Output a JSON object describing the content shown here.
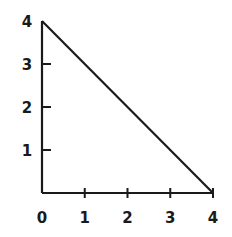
{
  "chart_data": {
    "type": "line",
    "title": "",
    "xlabel": "",
    "ylabel": "",
    "xlim": [
      0,
      4
    ],
    "ylim": [
      0,
      4
    ],
    "grid": false,
    "legend": null,
    "x_ticks": [
      "0",
      "1",
      "2",
      "3",
      "4"
    ],
    "y_ticks": [
      "1",
      "2",
      "3",
      "4"
    ],
    "series": [
      {
        "name": "line",
        "x": [
          0,
          4
        ],
        "y": [
          4,
          0
        ]
      }
    ],
    "style": {
      "line_color": "#1a1a1a",
      "background": "#ffffff"
    }
  }
}
